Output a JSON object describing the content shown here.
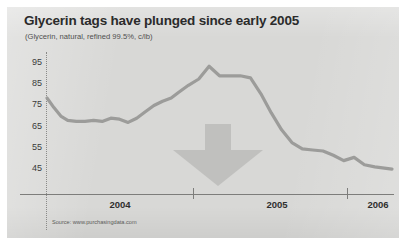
{
  "chart_data": {
    "type": "line",
    "title": "Glycerin tags have plunged since early 2005",
    "subtitle": "(Glycerin, natural, refined 99.5%, c/lb)",
    "xlabel": "",
    "ylabel": "",
    "ylim": [
      40,
      98
    ],
    "yticks": [
      95,
      85,
      75,
      65,
      55,
      45
    ],
    "xticks": [
      "2004",
      "2005",
      "2006"
    ],
    "grid": false,
    "legend": null,
    "source": "Source: www.purchasingdata.com",
    "annotation": "down-arrow",
    "line_color": "#9c9c9a",
    "series": [
      {
        "name": "Glycerin, natural, refined 99.5%, c/lb",
        "x": [
          0.0,
          2.0,
          4.0,
          6.0,
          8.5,
          11.0,
          13.5,
          16.0,
          18.5,
          21.0,
          23.5,
          26.0,
          28.5,
          31.0,
          33.5,
          36.0,
          38.0,
          41.0,
          44.0,
          47.0,
          50.0,
          53.0,
          56.0,
          59.0,
          62.0,
          65.0,
          68.0,
          71.0,
          74.0,
          77.0,
          80.0,
          83.0,
          86.0,
          89.0,
          92.0,
          95.0,
          100.0
        ],
        "values": [
          78.0,
          73.5,
          69.5,
          67.5,
          67.0,
          67.0,
          67.5,
          67.0,
          68.5,
          68.0,
          66.5,
          68.5,
          71.5,
          74.5,
          76.5,
          78.0,
          80.5,
          84.0,
          87.0,
          93.0,
          88.5,
          88.5,
          88.5,
          87.5,
          80.0,
          71.0,
          63.0,
          57.0,
          54.0,
          53.5,
          53.0,
          51.0,
          48.5,
          50.0,
          46.5,
          45.5,
          44.5
        ]
      }
    ]
  },
  "header": {
    "title": "Glycerin tags have plunged since early 2005",
    "subtitle": "(Glycerin, natural, refined 99.5%, c/lb)"
  },
  "axes": {
    "y": {
      "labels": [
        "95",
        "85",
        "75",
        "65",
        "55",
        "45"
      ]
    },
    "x": {
      "labels": [
        "2004",
        "2005",
        "2006"
      ]
    }
  },
  "footer": {
    "source": "Source: www.purchasingdata.com"
  }
}
